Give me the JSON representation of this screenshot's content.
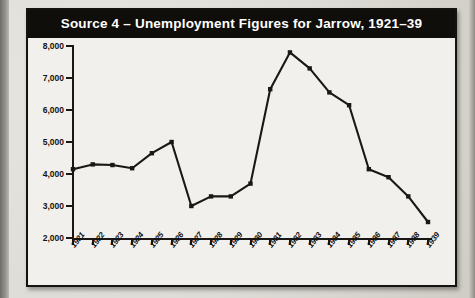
{
  "figure": {
    "title": "Source 4 – Unemployment Figures for Jarrow, 1921–39",
    "accent_color": "#100e0b",
    "panel_color": "#f2f0ec",
    "line_color": "#1a1714"
  },
  "chart_data": {
    "type": "line",
    "title": "Source 4 – Unemployment Figures for Jarrow, 1921–39",
    "xlabel": "",
    "ylabel": "",
    "categories": [
      "1921",
      "1922",
      "1923",
      "1924",
      "1925",
      "1926",
      "1927",
      "1928",
      "1929",
      "1930",
      "1931",
      "1932",
      "1933",
      "1934",
      "1935",
      "1936",
      "1937",
      "1938",
      "1939"
    ],
    "values": [
      4150,
      4300,
      4280,
      4180,
      4650,
      5000,
      3000,
      3300,
      3300,
      3700,
      6650,
      7800,
      7300,
      6550,
      6150,
      4150,
      3900,
      3300,
      2500
    ],
    "series": [
      {
        "name": "Unemployment in Jarrow",
        "values": [
          4150,
          4300,
          4280,
          4180,
          4650,
          5000,
          3000,
          3300,
          3300,
          3700,
          6650,
          7800,
          7300,
          6550,
          6150,
          4150,
          3900,
          3300,
          2500
        ]
      }
    ],
    "ylim": [
      2000,
      8000
    ],
    "yticks": [
      2000,
      3000,
      4000,
      5000,
      6000,
      7000,
      8000
    ],
    "ytick_labels": [
      "2,000",
      "3,000",
      "4,000",
      "5,000",
      "6,000",
      "7,000",
      "8,000"
    ],
    "grid": false,
    "legend": "none",
    "markers": "square"
  },
  "scan": {
    "ghost_text": ""
  }
}
